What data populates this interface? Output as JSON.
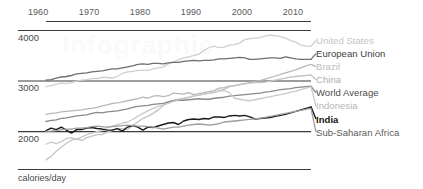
{
  "chart_data": {
    "type": "line",
    "title": "",
    "subtitle": "",
    "xlabel": "",
    "ylabel": "calories/day",
    "xlim": [
      1961,
      2013
    ],
    "ylim": [
      1250,
      4000
    ],
    "grid": true,
    "gridlines_y": [
      4000,
      3000,
      2000,
      1250
    ],
    "axis_position": "top",
    "legend_position": "right",
    "x_ticks": [
      "1960",
      "1970",
      "1980",
      "1990",
      "2000",
      "2010"
    ],
    "x_tick_values": [
      1960,
      1970,
      1980,
      1990,
      2000,
      2010
    ],
    "y_ticks": [
      "4000",
      "3000",
      "2000"
    ],
    "y_tick_values": [
      4000,
      3000,
      2000
    ],
    "x": [
      1961,
      1962,
      1963,
      1964,
      1965,
      1966,
      1967,
      1968,
      1969,
      1970,
      1971,
      1972,
      1973,
      1974,
      1975,
      1976,
      1977,
      1978,
      1979,
      1980,
      1981,
      1982,
      1983,
      1984,
      1985,
      1986,
      1987,
      1988,
      1989,
      1990,
      1991,
      1992,
      1993,
      1994,
      1995,
      1996,
      1997,
      1998,
      1999,
      2000,
      2001,
      2002,
      2003,
      2004,
      2005,
      2006,
      2007,
      2008,
      2009,
      2010,
      2011,
      2012,
      2013
    ],
    "series": [
      {
        "name": "United States",
        "color": "#cfcfcf",
        "width": 1.3,
        "values": [
          2880,
          2900,
          2930,
          2950,
          2940,
          2960,
          2990,
          3010,
          3020,
          3040,
          3040,
          3060,
          3060,
          3050,
          3080,
          3140,
          3170,
          3180,
          3200,
          3200,
          3200,
          3230,
          3250,
          3270,
          3330,
          3370,
          3410,
          3450,
          3470,
          3500,
          3520,
          3600,
          3650,
          3680,
          3650,
          3660,
          3700,
          3710,
          3740,
          3810,
          3830,
          3840,
          3850,
          3880,
          3900,
          3890,
          3870,
          3840,
          3790,
          3760,
          3700,
          3680,
          3680
        ]
      },
      {
        "name": "European Union",
        "color": "#6e6e6e",
        "width": 1.3,
        "values": [
          3010,
          3020,
          3050,
          3070,
          3080,
          3100,
          3130,
          3140,
          3150,
          3170,
          3180,
          3190,
          3210,
          3230,
          3230,
          3250,
          3270,
          3290,
          3320,
          3330,
          3320,
          3340,
          3340,
          3330,
          3350,
          3360,
          3360,
          3380,
          3390,
          3400,
          3390,
          3400,
          3400,
          3410,
          3430,
          3430,
          3440,
          3450,
          3460,
          3450,
          3420,
          3420,
          3430,
          3440,
          3450,
          3450,
          3440,
          3470,
          3450,
          3430,
          3420,
          3420,
          3420
        ]
      },
      {
        "name": "Brazil",
        "color": "#b8b8b8",
        "width": 1.3,
        "values": [
          2330,
          2350,
          2360,
          2380,
          2390,
          2400,
          2410,
          2420,
          2440,
          2450,
          2470,
          2500,
          2520,
          2550,
          2560,
          2580,
          2600,
          2620,
          2640,
          2670,
          2650,
          2690,
          2700,
          2680,
          2700,
          2750,
          2740,
          2730,
          2760,
          2720,
          2740,
          2760,
          2780,
          2800,
          2850,
          2860,
          2890,
          2900,
          2920,
          2940,
          2960,
          2990,
          3000,
          3030,
          3060,
          3090,
          3120,
          3150,
          3180,
          3210,
          3250,
          3290,
          3320
        ]
      },
      {
        "name": "China",
        "color": "#c4c4c4",
        "width": 1.3,
        "values": [
          1430,
          1500,
          1600,
          1680,
          1760,
          1820,
          1850,
          1810,
          1870,
          1900,
          1930,
          1930,
          1980,
          2010,
          2050,
          2050,
          2030,
          2110,
          2180,
          2250,
          2290,
          2350,
          2420,
          2500,
          2580,
          2610,
          2630,
          2640,
          2660,
          2690,
          2710,
          2730,
          2750,
          2760,
          2800,
          2830,
          2880,
          2900,
          2920,
          2940,
          2950,
          2960,
          2960,
          2970,
          2990,
          3010,
          3030,
          3050,
          3070,
          3080,
          3090,
          3100,
          3110
        ]
      },
      {
        "name": "World Average",
        "color": "#8a8a8a",
        "width": 1.3,
        "values": [
          2190,
          2210,
          2220,
          2250,
          2260,
          2280,
          2300,
          2310,
          2320,
          2350,
          2370,
          2360,
          2380,
          2390,
          2400,
          2420,
          2440,
          2470,
          2490,
          2500,
          2510,
          2530,
          2540,
          2550,
          2580,
          2600,
          2610,
          2610,
          2620,
          2630,
          2640,
          2630,
          2630,
          2650,
          2660,
          2670,
          2690,
          2700,
          2710,
          2720,
          2730,
          2740,
          2750,
          2770,
          2780,
          2800,
          2820,
          2830,
          2840,
          2860,
          2870,
          2880,
          2890
        ]
      },
      {
        "name": "Indonesia",
        "color": "#c9c9c9",
        "width": 1.3,
        "values": [
          1740,
          1780,
          1750,
          1790,
          1850,
          1870,
          1830,
          1880,
          1930,
          1960,
          1990,
          2010,
          2070,
          2100,
          2130,
          2160,
          2180,
          2230,
          2290,
          2350,
          2400,
          2450,
          2490,
          2520,
          2550,
          2590,
          2620,
          2650,
          2670,
          2700,
          2710,
          2730,
          2750,
          2770,
          2790,
          2800,
          2760,
          2650,
          2630,
          2610,
          2600,
          2620,
          2640,
          2660,
          2680,
          2700,
          2720,
          2740,
          2770,
          2790,
          2820,
          2850,
          2880
        ]
      },
      {
        "name": "India",
        "color": "#1a1a1a",
        "width": 1.4,
        "values": [
          2010,
          2060,
          2030,
          2080,
          2020,
          1960,
          2030,
          2030,
          2060,
          2070,
          2050,
          2040,
          2020,
          2020,
          2050,
          2000,
          2080,
          2110,
          2080,
          2020,
          2080,
          2070,
          2100,
          2130,
          2160,
          2170,
          2130,
          2200,
          2230,
          2240,
          2230,
          2250,
          2240,
          2280,
          2280,
          2270,
          2300,
          2310,
          2300,
          2310,
          2280,
          2240,
          2250,
          2260,
          2270,
          2290,
          2310,
          2330,
          2360,
          2390,
          2420,
          2450,
          2480
        ]
      },
      {
        "name": "Sub-Saharan Africa",
        "color": "#9e9e9e",
        "width": 1.3,
        "values": [
          1990,
          2000,
          2010,
          2030,
          2040,
          2040,
          2060,
          2060,
          2070,
          2090,
          2100,
          2090,
          2080,
          2090,
          2100,
          2110,
          2120,
          2110,
          2100,
          2100,
          2090,
          2080,
          2060,
          2040,
          2060,
          2080,
          2080,
          2100,
          2120,
          2130,
          2140,
          2130,
          2120,
          2130,
          2150,
          2180,
          2190,
          2200,
          2210,
          2220,
          2230,
          2240,
          2250,
          2270,
          2290,
          2310,
          2330,
          2350,
          2370,
          2390,
          2410,
          2430,
          2450
        ]
      }
    ]
  },
  "legend": {
    "items": [
      {
        "label": "United States",
        "color": "#c4c4c4",
        "weight": "normal"
      },
      {
        "label": "European Union",
        "color": "#3d3d3d",
        "weight": "normal"
      },
      {
        "label": "Brazil",
        "color": "#bcbcbc",
        "weight": "normal"
      },
      {
        "label": "China",
        "color": "#b0b0b0",
        "weight": "normal"
      },
      {
        "label": "World Average",
        "color": "#4a4a4a",
        "weight": "normal"
      },
      {
        "label": "Indonesia",
        "color": "#b5b5b5",
        "weight": "normal"
      },
      {
        "label": "India",
        "color": "#111111",
        "weight": "bold"
      },
      {
        "label": "Sub-Saharan Africa",
        "color": "#5a5a5a",
        "weight": "normal"
      }
    ]
  },
  "axis": {
    "unit_label": "calories/day",
    "y_labels": [
      "4000",
      "3000",
      "2000"
    ],
    "x_labels": [
      "1960",
      "1970",
      "1980",
      "1990",
      "2000",
      "2010"
    ]
  },
  "watermark": {
    "text": "Infographic"
  }
}
